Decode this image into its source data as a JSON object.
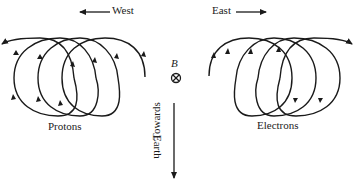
{
  "diagram": {
    "labels": {
      "west": "West",
      "east": "East",
      "protons": "Protons",
      "electrons": "Electrons",
      "b_field": "B",
      "towards": "Towards",
      "earth": "Earth"
    },
    "symbols": {
      "b_field_direction": "into-page (circled cross)"
    },
    "colors": {
      "stroke": "#1a1a1a",
      "background": "#ffffff"
    }
  }
}
